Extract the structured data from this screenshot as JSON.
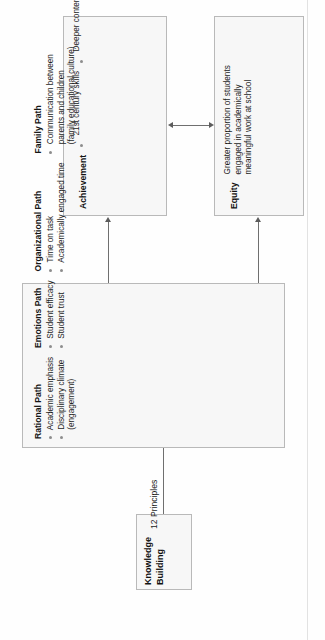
{
  "diagram": {
    "orientation": "rotated-90-ccw",
    "colors": {
      "box_fill": "#f7f7f7",
      "box_border": "#b9b9b9",
      "connector": "#6f6f6f",
      "bullet": "#8d8d8d",
      "text": "#1d1d1d"
    },
    "nodes": {
      "achievement": {
        "heading": "Achievement",
        "items": [
          "21st century skills",
          "Deeper content knowledge",
          "Performance to mastery learning orientation"
        ],
        "items_lines": [
          [
            "21st century skills"
          ],
          [
            "Deeper content knowledge"
          ],
          [
            "Performance to mastery learning",
            "orientation"
          ]
        ]
      },
      "equity": {
        "heading": "Equity",
        "items": [
          "Greater proportion of students engaged in academically meaningful work at school"
        ],
        "items_lines": [
          [
            "Greater proportion of students",
            "engaged in academically",
            "meaningful work at school"
          ]
        ]
      },
      "paths": {
        "groups": [
          {
            "title": "Rational Path",
            "items_lines": [
              [
                "Academic emphasis"
              ],
              [
                "Disciplinary climate",
                "(engagement)"
              ]
            ]
          },
          {
            "title": "Emotions Path",
            "items_lines": [
              [
                "Student efficacy"
              ],
              [
                "Student trust"
              ]
            ]
          },
          {
            "title": "Organizational Path",
            "items_lines": [
              [
                "Time on task"
              ],
              [
                "Academically engaged time"
              ]
            ]
          },
          {
            "title": "Family Path",
            "items_lines": [
              [
                "Communication between",
                "parents and children",
                "(family educational culture)"
              ]
            ]
          }
        ]
      },
      "knowledge_building": {
        "title_lines": [
          "Knowledge",
          "Building"
        ],
        "subtitle": "12 Principles"
      }
    },
    "connectors": [
      {
        "name": "achievement-equity-bidirectional",
        "from": "achievement",
        "to": "equity",
        "arrowheads": "both"
      },
      {
        "name": "paths-to-achievement",
        "from": "paths",
        "to": "achievement",
        "arrowheads": "to"
      },
      {
        "name": "paths-to-equity",
        "from": "paths",
        "to": "equity",
        "arrowheads": "to"
      },
      {
        "name": "knowledge-building-to-paths",
        "from": "knowledge_building",
        "to": "paths",
        "arrowheads": "none"
      }
    ]
  }
}
